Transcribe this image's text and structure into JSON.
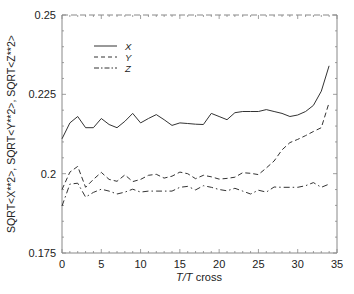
{
  "chart_data": {
    "type": "line",
    "title": "",
    "xlabel": "T/T cross",
    "xlabel_parts": {
      "italic": "T/T",
      "normal": " cross"
    },
    "ylabel": "SQRT<X**2>, SQRT<Y**2>, SQRT<Z**2>",
    "xlim": [
      0,
      35
    ],
    "ylim": [
      0.175,
      0.25
    ],
    "xticks": [
      0,
      5,
      10,
      15,
      20,
      25,
      30,
      35
    ],
    "xtick_labels": [
      "0",
      "5",
      "10",
      "15",
      "20",
      "25",
      "30",
      "35"
    ],
    "yticks": [
      0.175,
      0.2,
      0.225,
      0.25
    ],
    "ytick_labels": [
      "0.175",
      "0.2",
      "0.225",
      "0.25"
    ],
    "grid": false,
    "legend_position": "upper-left (inside)",
    "x": [
      0,
      1,
      2,
      3,
      4,
      5,
      6,
      7,
      8,
      9,
      10,
      11,
      12,
      13,
      14,
      15,
      16,
      17,
      18,
      19,
      20,
      21,
      22,
      23,
      24,
      25,
      26,
      27,
      28,
      29,
      30,
      31,
      32,
      33,
      34
    ],
    "series": [
      {
        "name": "X",
        "style": "solid",
        "values": [
          0.211,
          0.216,
          0.218,
          0.2145,
          0.2145,
          0.2174,
          0.2155,
          0.2145,
          0.2165,
          0.219,
          0.216,
          0.2174,
          0.2186,
          0.217,
          0.2152,
          0.216,
          0.2158,
          0.2156,
          0.2155,
          0.219,
          0.218,
          0.217,
          0.2192,
          0.2196,
          0.2196,
          0.2196,
          0.2202,
          0.2196,
          0.219,
          0.218,
          0.2185,
          0.2196,
          0.2215,
          0.226,
          0.234
        ]
      },
      {
        "name": "Y",
        "style": "dashed",
        "values": [
          0.195,
          0.2005,
          0.2023,
          0.1957,
          0.1982,
          0.2004,
          0.1982,
          0.1976,
          0.1996,
          0.1975,
          0.1982,
          0.1995,
          0.1998,
          0.1986,
          0.1992,
          0.2005,
          0.2,
          0.1984,
          0.1995,
          0.199,
          0.1983,
          0.1985,
          0.1989,
          0.2003,
          0.2001,
          0.1997,
          0.2018,
          0.204,
          0.2075,
          0.2098,
          0.2108,
          0.212,
          0.2133,
          0.2145,
          0.2224
        ]
      },
      {
        "name": "Z",
        "style": "dash-dot",
        "values": [
          0.1898,
          0.1967,
          0.197,
          0.1926,
          0.1941,
          0.1951,
          0.1945,
          0.1936,
          0.1942,
          0.1951,
          0.1942,
          0.1945,
          0.1945,
          0.1945,
          0.1945,
          0.1957,
          0.196,
          0.1949,
          0.1962,
          0.1957,
          0.195,
          0.1946,
          0.1954,
          0.1945,
          0.1936,
          0.1948,
          0.1942,
          0.1958,
          0.1957,
          0.1957,
          0.1957,
          0.1962,
          0.1972,
          0.1957,
          0.1967
        ]
      }
    ]
  },
  "legend": [
    {
      "label": "X",
      "style": "solid"
    },
    {
      "label": "Y",
      "style": "dashed"
    },
    {
      "label": "Z",
      "style": "dash-dot"
    }
  ],
  "colors": {
    "line": "#333333",
    "axis": "#888888",
    "text": "#222222"
  }
}
